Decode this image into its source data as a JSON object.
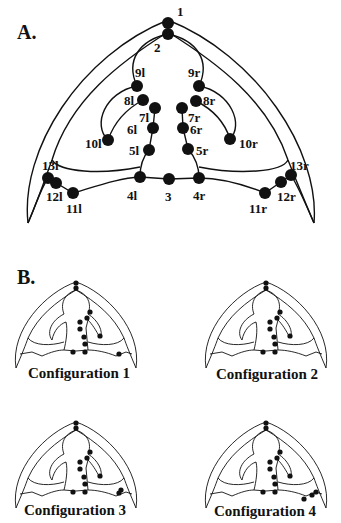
{
  "panels": {
    "a": {
      "label": "A."
    },
    "b": {
      "label": "B."
    }
  },
  "landmarks": [
    {
      "id": "1",
      "x": 168,
      "y": 23,
      "lx": 177,
      "ly": 16
    },
    {
      "id": "2",
      "x": 168,
      "y": 34,
      "lx": 154,
      "ly": 52
    },
    {
      "id": "9l",
      "x": 137,
      "y": 86,
      "lx": 135,
      "ly": 77
    },
    {
      "id": "9r",
      "x": 199,
      "y": 86,
      "lx": 188,
      "ly": 77
    },
    {
      "id": "8l",
      "x": 143,
      "y": 100,
      "lx": 124,
      "ly": 105
    },
    {
      "id": "8r",
      "x": 196,
      "y": 101,
      "lx": 203,
      "ly": 105
    },
    {
      "id": "7l",
      "x": 155,
      "y": 108,
      "lx": 139,
      "ly": 122
    },
    {
      "id": "7r",
      "x": 182,
      "y": 108,
      "lx": 188,
      "ly": 122
    },
    {
      "id": "6l",
      "x": 153,
      "y": 128,
      "lx": 127,
      "ly": 134
    },
    {
      "id": "6r",
      "x": 183,
      "y": 128,
      "lx": 190,
      "ly": 134
    },
    {
      "id": "10l",
      "x": 108,
      "y": 140,
      "lx": 85,
      "ly": 148
    },
    {
      "id": "10r",
      "x": 230,
      "y": 139,
      "lx": 239,
      "ly": 148
    },
    {
      "id": "5l",
      "x": 149,
      "y": 150,
      "lx": 129,
      "ly": 155
    },
    {
      "id": "5r",
      "x": 188,
      "y": 149,
      "lx": 196,
      "ly": 155
    },
    {
      "id": "4l",
      "x": 140,
      "y": 177,
      "lx": 127,
      "ly": 200
    },
    {
      "id": "3",
      "x": 169,
      "y": 179,
      "lx": 165,
      "ly": 201
    },
    {
      "id": "4r",
      "x": 199,
      "y": 178,
      "lx": 193,
      "ly": 200
    },
    {
      "id": "13l",
      "x": 48,
      "y": 178,
      "lx": 42,
      "ly": 170
    },
    {
      "id": "12l",
      "x": 56,
      "y": 183,
      "lx": 46,
      "ly": 201
    },
    {
      "id": "11l",
      "x": 73,
      "y": 193,
      "lx": 66,
      "ly": 213
    },
    {
      "id": "13r",
      "x": 291,
      "y": 175,
      "lx": 290,
      "ly": 170
    },
    {
      "id": "12r",
      "x": 281,
      "y": 182,
      "lx": 277,
      "ly": 201
    },
    {
      "id": "11r",
      "x": 265,
      "y": 193,
      "lx": 249,
      "ly": 213
    }
  ],
  "configurations": [
    {
      "caption": "Configuration 1",
      "lateral": [
        "12"
      ]
    },
    {
      "caption": "Configuration 2",
      "lateral": []
    },
    {
      "caption": "Configuration 3",
      "lateral": [
        "13",
        "12"
      ]
    },
    {
      "caption": "Configuration 4",
      "lateral": [
        "13",
        "12",
        "11"
      ]
    }
  ],
  "captions": {
    "c1": "Configuration 1",
    "c2": "Configuration 2",
    "c3": "Configuration 3",
    "c4": "Configuration 4"
  }
}
